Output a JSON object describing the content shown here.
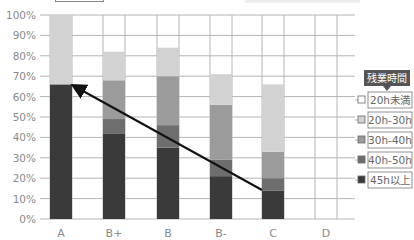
{
  "chart_data": {
    "type": "bar",
    "stacked": true,
    "title": "",
    "xlabel": "",
    "ylabel": "",
    "ylim": [
      0,
      100
    ],
    "y_ticks": [
      "0%",
      "10%",
      "20%",
      "30%",
      "40%",
      "50%",
      "60%",
      "70%",
      "80%",
      "90%",
      "100%"
    ],
    "grid": true,
    "categories": [
      "A",
      "B+",
      "B",
      "B-",
      "C",
      "D"
    ],
    "series": [
      {
        "name": "45h以上",
        "color": "#3a3a3a",
        "values": [
          66,
          42,
          35,
          21,
          14,
          0
        ]
      },
      {
        "name": "40h-50h",
        "color": "#6e6e6e",
        "values": [
          0,
          7,
          11,
          8,
          6,
          0
        ]
      },
      {
        "name": "30h-40h",
        "color": "#9b9b9b",
        "values": [
          0,
          19,
          24,
          27,
          13,
          0
        ]
      },
      {
        "name": "20h-30h",
        "color": "#d2d2d2",
        "values": [
          34,
          14,
          14,
          15,
          33,
          0
        ]
      },
      {
        "name": "20h未満",
        "color": "#ffffff",
        "values": [
          0,
          18,
          16,
          29,
          34,
          100
        ]
      }
    ],
    "legend": {
      "title": "残業時間",
      "position": "right",
      "items": [
        "20h未満",
        "20h-30h",
        "30h-40h",
        "40h-50h",
        "45h以上"
      ],
      "colors": [
        "#ffffff",
        "#d2d2d2",
        "#9b9b9b",
        "#6e6e6e",
        "#3a3a3a"
      ]
    },
    "annotations": [
      {
        "type": "arrow",
        "from_category": "C",
        "from_value": 14,
        "to_category": "A",
        "to_value": 66,
        "color": "#111111"
      }
    ]
  },
  "colors": {
    "grid": "#b4b4b4",
    "axis_text": "#8a8a8a",
    "legend_header_bg": "#555555",
    "legend_header_text": "#ffffff",
    "bar_border": "#9a9a9a"
  }
}
